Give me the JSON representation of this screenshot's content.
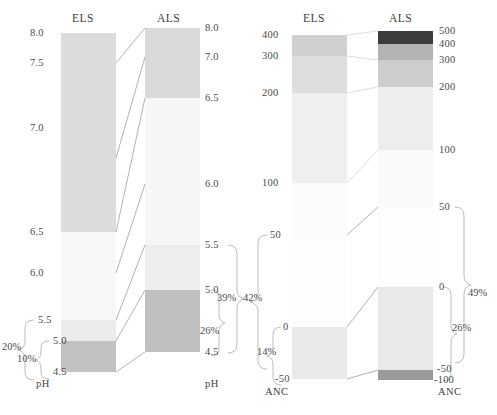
{
  "figure": {
    "type": "paired-stacked-column-comparison",
    "panels": [
      {
        "name": "pH",
        "axis_label": "pH",
        "columns": [
          {
            "name": "ELS",
            "header": "ELS",
            "tick_labels": [
              "8.0",
              "7.5",
              "7.0",
              "6.5",
              "6.0",
              "5.5",
              "5.0",
              "4.5"
            ],
            "tick_values": [
              8.0,
              7.5,
              7.0,
              6.5,
              6.0,
              5.5,
              5.0,
              4.5
            ],
            "segments": [
              {
                "from": 8.0,
                "to": 6.5,
                "color": "#dcdcdc"
              },
              {
                "from": 6.5,
                "to": 5.5,
                "color": "#f7f7f7"
              },
              {
                "from": 5.5,
                "to": 5.0,
                "color": "#ececec"
              },
              {
                "from": 5.0,
                "to": 4.5,
                "color": "#c2c2c2"
              }
            ],
            "brackets": [
              {
                "label": "20%",
                "from": 5.5,
                "to": 4.5
              },
              {
                "label": "10%",
                "from": 5.0,
                "to": 4.5
              }
            ]
          },
          {
            "name": "ALS",
            "header": "ALS",
            "tick_labels": [
              "8.0",
              "7.0",
              "6.5",
              "6.0",
              "5.5",
              "5.0",
              "4.5"
            ],
            "tick_values": [
              8.0,
              7.0,
              6.5,
              6.0,
              5.5,
              5.0,
              4.5
            ],
            "segments": [
              {
                "from": 8.0,
                "to": 6.5,
                "color": "#dadada"
              },
              {
                "from": 6.5,
                "to": 5.5,
                "color": "#f6f6f6"
              },
              {
                "from": 5.5,
                "to": 5.0,
                "color": "#ededed"
              },
              {
                "from": 5.0,
                "to": 4.5,
                "color": "#c0c0c0"
              }
            ],
            "brackets": [
              {
                "label": "39%",
                "from": 5.5,
                "to": 4.5
              },
              {
                "label": "26%",
                "from": 5.0,
                "to": 4.5
              }
            ]
          }
        ]
      },
      {
        "name": "ANC",
        "axis_label": "ANC",
        "columns": [
          {
            "name": "ELS",
            "header": "ELS",
            "tick_labels": [
              "400",
              "300",
              "200",
              "100",
              "50",
              "0",
              "-50"
            ],
            "tick_values": [
              400,
              300,
              200,
              100,
              50,
              0,
              -50
            ],
            "segments": [
              {
                "from": 400,
                "to": 300,
                "color": "#d0d0d0"
              },
              {
                "from": 300,
                "to": 200,
                "color": "#dedede"
              },
              {
                "from": 200,
                "to": 100,
                "color": "#efefef"
              },
              {
                "from": 100,
                "to": 50,
                "color": "#fbfbfb"
              },
              {
                "from": 50,
                "to": 0,
                "color": "#fdfdfd"
              },
              {
                "from": 0,
                "to": -50,
                "color": "#eaeaea"
              }
            ],
            "brackets": [
              {
                "label": "42%",
                "from": 50,
                "to": -50
              },
              {
                "label": "14%",
                "from": 0,
                "to": -50
              }
            ]
          },
          {
            "name": "ALS",
            "header": "ALS",
            "tick_labels": [
              "500",
              "400",
              "300",
              "200",
              "100",
              "50",
              "0",
              "-50",
              "-100"
            ],
            "tick_values": [
              500,
              400,
              300,
              200,
              100,
              50,
              0,
              -50,
              -100
            ],
            "segments": [
              {
                "from": 500,
                "to": 400,
                "color": "#3c3c3c"
              },
              {
                "from": 400,
                "to": 300,
                "color": "#b4b4b4"
              },
              {
                "from": 300,
                "to": 200,
                "color": "#cdcdcd"
              },
              {
                "from": 200,
                "to": 100,
                "color": "#ededed"
              },
              {
                "from": 100,
                "to": 50,
                "color": "#fafafa"
              },
              {
                "from": 50,
                "to": 0,
                "color": "#fdfdfd"
              },
              {
                "from": 0,
                "to": -50,
                "color": "#e9e9e9"
              },
              {
                "from": -50,
                "to": -100,
                "color": "#9a9a9a"
              }
            ],
            "brackets": [
              {
                "label": "49%",
                "from": 50,
                "to": -100
              },
              {
                "label": "26%",
                "from": 0,
                "to": -100
              }
            ]
          }
        ]
      }
    ]
  },
  "headers": {
    "ph_els": "ELS",
    "ph_als": "ALS",
    "anc_els": "ELS",
    "anc_als": "ALS"
  },
  "axis_names": {
    "ph_els": "pH",
    "ph_als": "pH",
    "anc_els": "ANC",
    "anc_als": "ANC"
  },
  "ticks": {
    "ph_els": [
      {
        "text": "8.0",
        "y": 33
      },
      {
        "text": "7.5",
        "y": 63
      },
      {
        "text": "7.0",
        "y": 128
      },
      {
        "text": "6.5",
        "y": 232
      },
      {
        "text": "6.0",
        "y": 273
      },
      {
        "text": "5.5",
        "y": 320
      },
      {
        "text": "5.0",
        "y": 341
      },
      {
        "text": "4.5",
        "y": 372
      }
    ],
    "ph_als": [
      {
        "text": "8.0",
        "y": 28
      },
      {
        "text": "7.0",
        "y": 57
      },
      {
        "text": "6.5",
        "y": 98
      },
      {
        "text": "6.0",
        "y": 184
      },
      {
        "text": "5.5",
        "y": 245
      },
      {
        "text": "5.0",
        "y": 290
      },
      {
        "text": "4.5",
        "y": 352
      }
    ],
    "anc_els": [
      {
        "text": "400",
        "y": 35
      },
      {
        "text": "300",
        "y": 56
      },
      {
        "text": "200",
        "y": 93
      },
      {
        "text": "100",
        "y": 183
      },
      {
        "text": "50",
        "y": 235
      },
      {
        "text": "0",
        "y": 327
      },
      {
        "text": "-50",
        "y": 379
      }
    ],
    "anc_als": [
      {
        "text": "500",
        "y": 31
      },
      {
        "text": "400",
        "y": 44
      },
      {
        "text": "300",
        "y": 60
      },
      {
        "text": "200",
        "y": 87
      },
      {
        "text": "100",
        "y": 150
      },
      {
        "text": "50",
        "y": 207
      },
      {
        "text": "0",
        "y": 287
      },
      {
        "text": "-50",
        "y": 370
      },
      {
        "text": "-100",
        "y": 380
      }
    ]
  },
  "percentages": {
    "ph_els_outer": "20%",
    "ph_els_inner": "10%",
    "ph_als_outer": "39%",
    "ph_als_inner": "26%",
    "anc_els_outer": "42%",
    "anc_els_inner": "14%",
    "anc_als_outer": "49%",
    "anc_als_inner": "26%"
  },
  "colors": {
    "background": "#ffffff",
    "text": "#4a4a4a",
    "connector": "#9a9a9a",
    "bracket": "#b0b0b0",
    "darkest": "#3c3c3c",
    "lightest": "#fdfdfd"
  }
}
